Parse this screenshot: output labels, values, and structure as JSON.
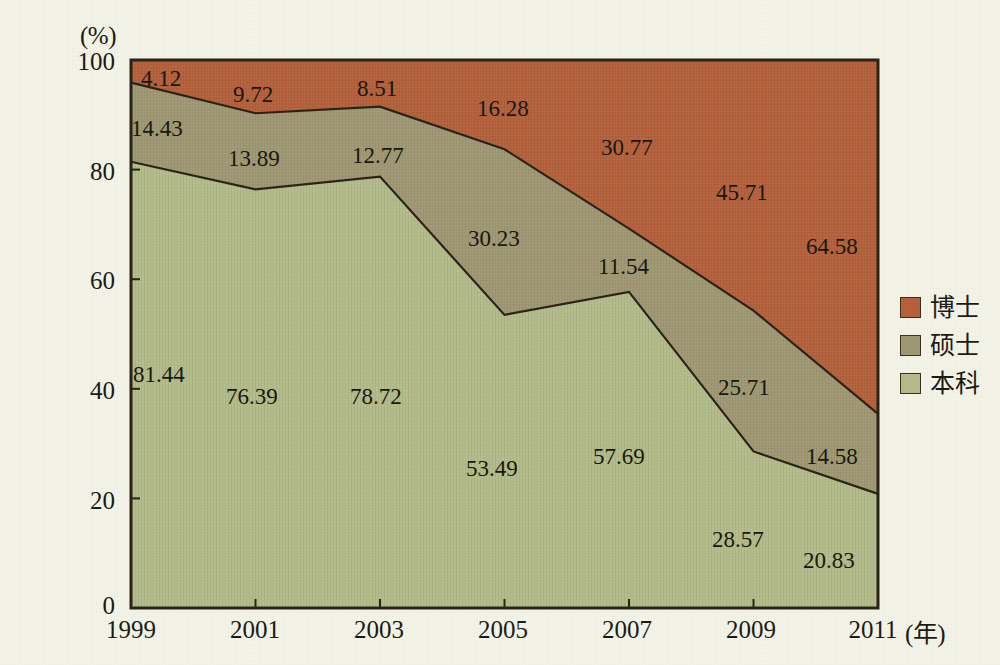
{
  "chart_data": {
    "type": "area",
    "stacked": true,
    "normalized_percent": true,
    "title": "",
    "subtitle": "",
    "xlabel": "(年)",
    "ylabel": "(%)",
    "categories": [
      "1999",
      "2001",
      "2003",
      "2005",
      "2007",
      "2009",
      "2011"
    ],
    "x_tick_labels": [
      "1999",
      "2001",
      "2003",
      "2005",
      "2007",
      "2009",
      "2011"
    ],
    "y_tick_labels": [
      "0",
      "20",
      "40",
      "60",
      "80",
      "100"
    ],
    "y_ticks": [
      0,
      20,
      40,
      60,
      80,
      100
    ],
    "ylim": [
      0,
      100
    ],
    "grid": false,
    "legend_position": "right",
    "stack_order_bottom_to_top": [
      "本科",
      "硕士",
      "博士"
    ],
    "series": [
      {
        "name": "本科",
        "color": "#b3bc8a",
        "values": [
          81.44,
          76.39,
          78.72,
          53.49,
          57.69,
          28.57,
          20.83
        ],
        "labels": [
          "81.44",
          "76.39",
          "78.72",
          "53.49",
          "57.69",
          "28.57",
          "20.83"
        ]
      },
      {
        "name": "硕士",
        "color": "#a09873",
        "values": [
          14.43,
          13.89,
          12.77,
          30.23,
          11.54,
          25.71,
          14.58
        ],
        "labels": [
          "14.43",
          "13.89",
          "12.77",
          "30.23",
          "11.54",
          "25.71",
          "14.58"
        ]
      },
      {
        "name": "博士",
        "color": "#b4613c",
        "values": [
          4.12,
          9.72,
          8.51,
          16.28,
          30.77,
          45.71,
          64.58
        ],
        "labels": [
          "4.12",
          "9.72",
          "8.51",
          "16.28",
          "30.77",
          "45.71",
          "64.58"
        ]
      }
    ],
    "annotations": []
  },
  "axes": {
    "y_unit": "(%)",
    "x_unit": "(年)",
    "y_ticks": [
      {
        "label": "100"
      },
      {
        "label": "80"
      },
      {
        "label": "60"
      },
      {
        "label": "40"
      },
      {
        "label": "20"
      },
      {
        "label": "0"
      }
    ],
    "x_ticks": [
      {
        "label": "1999"
      },
      {
        "label": "2001"
      },
      {
        "label": "2003"
      },
      {
        "label": "2005"
      },
      {
        "label": "2007"
      },
      {
        "label": "2009"
      },
      {
        "label": "2011"
      }
    ]
  },
  "legend": {
    "items": [
      {
        "label": "博士",
        "color": "#b4613c"
      },
      {
        "label": "硕士",
        "color": "#a09873"
      },
      {
        "label": "本科",
        "color": "#b3bc8a"
      }
    ]
  },
  "value_labels": {
    "doctorate": [
      "4.12",
      "9.72",
      "8.51",
      "16.28",
      "30.77",
      "45.71",
      "64.58"
    ],
    "master": [
      "14.43",
      "13.89",
      "12.77",
      "30.23",
      "11.54",
      "25.71",
      "14.58"
    ],
    "bachelor": [
      "81.44",
      "76.39",
      "78.72",
      "53.49",
      "57.69",
      "28.57",
      "20.83"
    ]
  },
  "colors": {
    "doctorate": "#b4613c",
    "master": "#a09873",
    "bachelor": "#b3bc8a",
    "outline": "#2a2418",
    "background": "#f3f3e7"
  }
}
